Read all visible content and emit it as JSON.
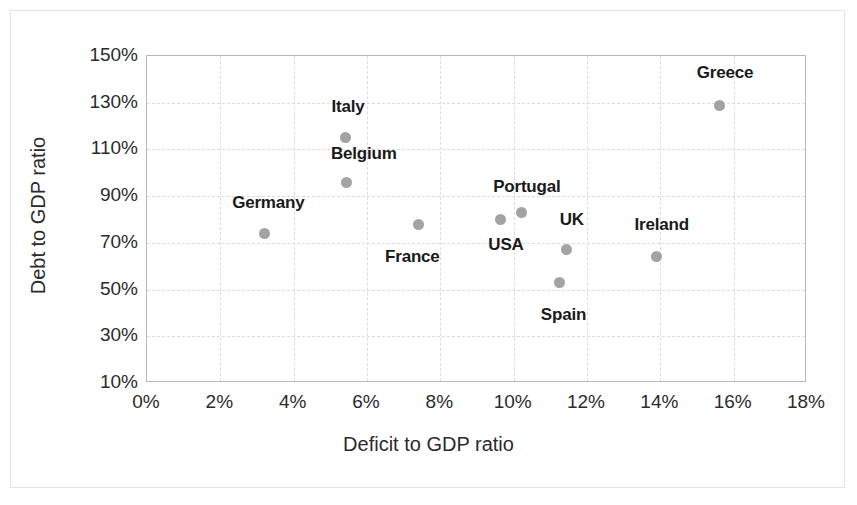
{
  "chart_data": {
    "type": "scatter",
    "title": "",
    "xlabel": "Deficit to GDP ratio",
    "ylabel": "Debt to GDP ratio",
    "xlim": [
      0,
      18
    ],
    "ylim": [
      10,
      150
    ],
    "xtick_labels": [
      "0%",
      "2%",
      "4%",
      "6%",
      "8%",
      "10%",
      "12%",
      "14%",
      "16%",
      "18%"
    ],
    "xticks": [
      0,
      2,
      4,
      6,
      8,
      10,
      12,
      14,
      16,
      18
    ],
    "ytick_labels": [
      "10%",
      "30%",
      "50%",
      "70%",
      "90%",
      "110%",
      "130%",
      "150%"
    ],
    "yticks": [
      10,
      30,
      50,
      70,
      90,
      110,
      130,
      150
    ],
    "grid": true,
    "legend": "none",
    "marker_color": "#a3a3a3",
    "points": [
      {
        "label": "Germany",
        "x": 3.2,
        "y": 74,
        "label_dx": 4,
        "label_dy": -31
      },
      {
        "label": "Italy",
        "x": 5.4,
        "y": 115,
        "label_dx": 3,
        "label_dy": -31
      },
      {
        "label": "Belgium",
        "x": 5.45,
        "y": 96,
        "label_dx": 17,
        "label_dy": -28
      },
      {
        "label": "France",
        "x": 7.4,
        "y": 78,
        "label_dx": -6,
        "label_dy": 33
      },
      {
        "label": "Portugal",
        "x": 9.65,
        "y": 80,
        "label_dx": 26,
        "label_dy": -33
      },
      {
        "label": "USA",
        "x": 10.2,
        "y": 83,
        "label_dx": -15,
        "label_dy": 33
      },
      {
        "label": "UK",
        "x": 11.45,
        "y": 67,
        "label_dx": 5,
        "label_dy": -30
      },
      {
        "label": "Spain",
        "x": 11.25,
        "y": 53,
        "label_dx": 4,
        "label_dy": 32
      },
      {
        "label": "Ireland",
        "x": 13.9,
        "y": 64,
        "label_dx": 5,
        "label_dy": -32
      },
      {
        "label": "Greece",
        "x": 15.6,
        "y": 129,
        "label_dx": 6,
        "label_dy": -32
      }
    ]
  }
}
